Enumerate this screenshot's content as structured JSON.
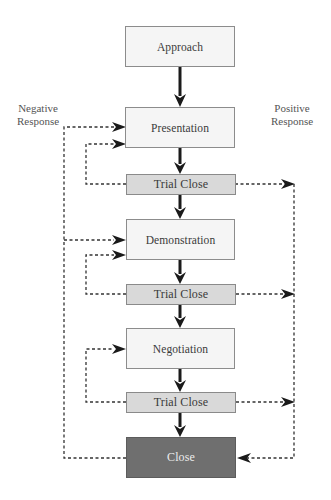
{
  "diagram": {
    "type": "flowchart",
    "title": "",
    "side_labels": {
      "negative": {
        "line1": "Negative",
        "line2": "Response"
      },
      "positive": {
        "line1": "Positive",
        "line2": "Response"
      }
    },
    "nodes": [
      {
        "id": "approach",
        "label": "Approach",
        "kind": "step"
      },
      {
        "id": "presentation",
        "label": "Presentation",
        "kind": "step"
      },
      {
        "id": "trial1",
        "label": "Trial Close",
        "kind": "trial"
      },
      {
        "id": "demonstration",
        "label": "Demonstration",
        "kind": "step"
      },
      {
        "id": "trial2",
        "label": "Trial Close",
        "kind": "trial"
      },
      {
        "id": "negotiation",
        "label": "Negotiation",
        "kind": "step"
      },
      {
        "id": "trial3",
        "label": "Trial Close",
        "kind": "trial"
      },
      {
        "id": "close",
        "label": "Close",
        "kind": "final"
      }
    ],
    "edges": [
      {
        "from": "approach",
        "to": "presentation",
        "style": "solid"
      },
      {
        "from": "presentation",
        "to": "trial1",
        "style": "solid"
      },
      {
        "from": "trial1",
        "to": "demonstration",
        "style": "solid"
      },
      {
        "from": "demonstration",
        "to": "trial2",
        "style": "solid"
      },
      {
        "from": "trial2",
        "to": "negotiation",
        "style": "solid"
      },
      {
        "from": "negotiation",
        "to": "trial3",
        "style": "solid"
      },
      {
        "from": "trial3",
        "to": "close",
        "style": "solid"
      },
      {
        "from": "trial1",
        "to": "presentation",
        "style": "dashed",
        "meaning": "negative response loop"
      },
      {
        "from": "trial2",
        "to": "demonstration",
        "style": "dashed",
        "meaning": "negative response loop"
      },
      {
        "from": "trial3",
        "to": "negotiation",
        "style": "dashed",
        "meaning": "negative response loop"
      },
      {
        "from": "close",
        "to": "presentation",
        "style": "dashed",
        "meaning": "negative response"
      },
      {
        "from": "close",
        "to": "demonstration",
        "style": "dashed",
        "meaning": "negative response"
      },
      {
        "from": "trial1",
        "to": "close",
        "style": "dashed",
        "meaning": "positive response"
      },
      {
        "from": "trial2",
        "to": "close",
        "style": "dashed",
        "meaning": "positive response"
      },
      {
        "from": "trial3",
        "to": "close",
        "style": "dashed",
        "meaning": "positive response"
      }
    ],
    "colors": {
      "step_fill": "#f5f5f5",
      "trial_fill": "#d9d9d9",
      "close_fill": "#6f6f6f",
      "line": "#1a1a1a"
    }
  }
}
